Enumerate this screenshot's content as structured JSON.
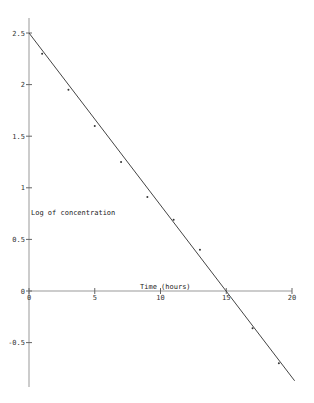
{
  "chart_data": {
    "type": "scatter",
    "title": "",
    "xlabel": "Time (hours)",
    "ylabel": "Log of concentration",
    "xlim": [
      0,
      20
    ],
    "ylim": [
      -0.9,
      2.6
    ],
    "x_ticks": [
      0,
      5,
      10,
      15,
      20
    ],
    "x_tick_labels": [
      "0",
      "5",
      "10",
      "15",
      "20"
    ],
    "y_ticks": [
      2.5,
      2,
      1.5,
      1,
      0.5,
      0,
      -0.5
    ],
    "y_tick_labels": [
      "2.5",
      "2",
      "1.5",
      "1",
      "0.5",
      "0",
      "-0.5"
    ],
    "grid": false,
    "legend": null,
    "series": [
      {
        "name": "observed",
        "type": "scatter",
        "x": [
          1,
          3,
          5,
          7,
          9,
          11,
          13,
          17,
          19
        ],
        "y": [
          2.3,
          1.95,
          1.6,
          1.25,
          0.91,
          0.69,
          0.4,
          -0.36,
          -0.7
        ]
      },
      {
        "name": "fit line",
        "type": "line",
        "x": [
          0,
          20.2
        ],
        "y": [
          2.5,
          -0.87
        ]
      }
    ]
  },
  "colors": {
    "axis": "#999999",
    "line": "#444444",
    "point": "#333333"
  }
}
